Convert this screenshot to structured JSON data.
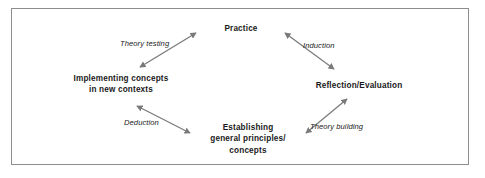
{
  "diagram": {
    "type": "cycle-diagram",
    "frame": {
      "border_color": "#8d8d8d",
      "background": "#ffffff"
    },
    "arrow_color": "#7a7a7a",
    "text_color": "#1a1a1a",
    "nodes": [
      {
        "id": "practice",
        "label": "Practice",
        "position": "top"
      },
      {
        "id": "implementing",
        "label": "Implementing concepts\nin new contexts",
        "position": "left"
      },
      {
        "id": "reflection",
        "label": "Reflection/Evaluation",
        "position": "right"
      },
      {
        "id": "establishing",
        "label": "Establishing\ngeneral principles/\nconcepts",
        "position": "bottom"
      }
    ],
    "edges": [
      {
        "id": "theory-testing",
        "label": "Theory testing",
        "from": "implementing",
        "to": "practice",
        "arrowheads": "both"
      },
      {
        "id": "induction",
        "label": "Induction",
        "from": "practice",
        "to": "reflection",
        "arrowheads": "both"
      },
      {
        "id": "deduction",
        "label": "Deduction",
        "from": "establishing",
        "to": "implementing",
        "arrowheads": "both"
      },
      {
        "id": "theory-building",
        "label": "Theory building",
        "from": "establishing",
        "to": "reflection",
        "arrowheads": "both"
      }
    ]
  }
}
